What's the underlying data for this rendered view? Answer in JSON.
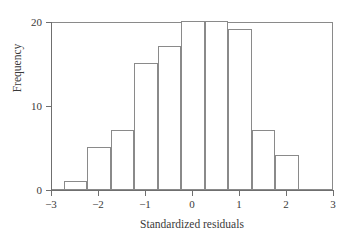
{
  "chart_data": {
    "type": "bar",
    "title": "",
    "subtitle": "",
    "xlabel": "Standardized residuals",
    "ylabel": "Frequency",
    "xlim": [
      -3,
      3
    ],
    "ylim": [
      0,
      20
    ],
    "grid": false,
    "legend": null,
    "bin_width": 0.5,
    "bin_edges": [
      -2.75,
      -2.25,
      -1.75,
      -1.25,
      -0.75,
      -0.25,
      0.25,
      0.75,
      1.25,
      1.75,
      2.25
    ],
    "categories": [
      "-2.75 to -2.25",
      "-2.25 to -1.75",
      "-1.75 to -1.25",
      "-1.25 to -0.75",
      "-0.75 to -0.25",
      "-0.25 to 0.25",
      "0.25 to 0.75",
      "0.75 to 1.25",
      "1.25 to 1.75",
      "1.75 to 2.25"
    ],
    "values": [
      1,
      5,
      7,
      15,
      17,
      20,
      20,
      19,
      7,
      4
    ],
    "xticks": [
      -3,
      -2,
      -1,
      0,
      1,
      2,
      3
    ],
    "xticklabels": [
      "−3",
      "−2",
      "−1",
      "0",
      "1",
      "2",
      "3"
    ],
    "yticks": [
      0,
      10,
      20
    ],
    "yticklabels": [
      "0",
      "10",
      "20"
    ],
    "colors": {
      "bar_fill": "#ffffff",
      "bar_edge": "#8a8a8a",
      "axis": "#6f6f6f",
      "text": "#3a3a3a",
      "background": "#ffffff"
    }
  }
}
